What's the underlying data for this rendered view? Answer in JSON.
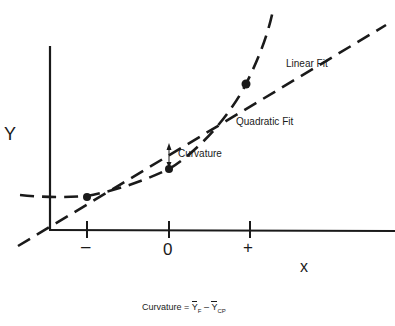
{
  "diagram": {
    "y_axis_label": "Y",
    "x_axis_label": "x",
    "ticks": [
      "–",
      "0",
      "+"
    ],
    "line_labels": {
      "linear": "Linear Fit",
      "quadratic": "Quadratic Fit",
      "curvature": "Curvature"
    },
    "formula": {
      "prefix": "Curvature = ",
      "term1": "Y",
      "sub1": "F",
      "minus": " – ",
      "term2": "Y",
      "sub2": "CP"
    },
    "points": [
      "factorial-low",
      "center-point",
      "factorial-high"
    ],
    "color": "#1a1a1a"
  }
}
